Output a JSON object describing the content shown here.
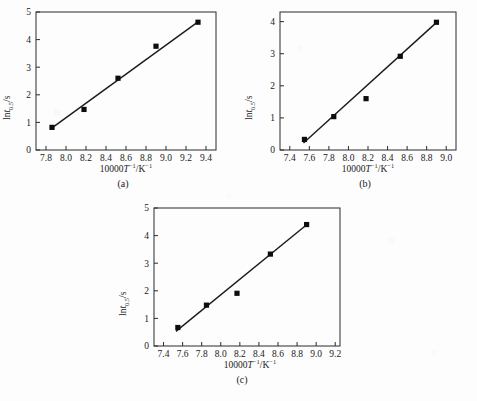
{
  "figure": {
    "background_color": "#fdfdfd",
    "line_color": "#1a1a1a",
    "marker_color": "#0d0d0d",
    "marker_shape": "filled-square"
  },
  "axis_titles": {
    "x_prefix": "10000",
    "x_variable": "T",
    "x_sup1": "−1",
    "x_mid": "/K",
    "x_sup2": "−1",
    "y_prefix": "ln",
    "y_variable": "t",
    "y_sub": "0.5",
    "y_suffix": "/s"
  },
  "chart_data": [
    {
      "type": "scatter",
      "panel": "a",
      "caption": "(a)",
      "title": "",
      "xlabel": "10000T⁻¹/K⁻¹",
      "ylabel": "ln t0.5/s",
      "xlim": [
        7.7,
        9.5
      ],
      "ylim": [
        0,
        5
      ],
      "xticks": [
        7.8,
        8.0,
        8.2,
        8.4,
        8.6,
        8.8,
        9.0,
        9.2,
        9.4
      ],
      "xtick_labels": [
        "7.8",
        "8.0",
        "8.2",
        "8.4",
        "8.6",
        "8.8",
        "9.0",
        "9.2",
        "9.4"
      ],
      "yticks": [
        0,
        1,
        2,
        3,
        4,
        5
      ],
      "ytick_labels": [
        "0",
        "1",
        "2",
        "3",
        "4",
        "5"
      ],
      "grid": false,
      "legend": "none",
      "x": [
        7.86,
        8.18,
        8.52,
        8.9,
        9.32
      ],
      "y": [
        0.82,
        1.47,
        2.6,
        3.76,
        4.63
      ],
      "fit_line": {
        "x": [
          7.86,
          9.32
        ],
        "y": [
          0.8,
          4.64
        ]
      }
    },
    {
      "type": "scatter",
      "panel": "b",
      "caption": "(b)",
      "title": "",
      "xlabel": "10000T⁻¹/K⁻¹",
      "ylabel": "ln t0.5/s",
      "xlim": [
        7.3,
        9.1
      ],
      "ylim": [
        0,
        4.3
      ],
      "xticks": [
        7.4,
        7.6,
        7.8,
        8.0,
        8.2,
        8.4,
        8.6,
        8.8,
        9.0
      ],
      "xtick_labels": [
        "7.4",
        "7.6",
        "7.8",
        "8.0",
        "8.2",
        "8.4",
        "8.6",
        "8.8",
        "9.0"
      ],
      "yticks": [
        0,
        1,
        2,
        3,
        4
      ],
      "ytick_labels": [
        "0",
        "1",
        "2",
        "3",
        "4"
      ],
      "grid": false,
      "legend": "none",
      "x": [
        7.55,
        7.85,
        8.18,
        8.53,
        8.9
      ],
      "y": [
        0.33,
        1.04,
        1.6,
        2.92,
        3.98
      ],
      "fit_line": {
        "x": [
          7.54,
          8.91
        ],
        "y": [
          0.22,
          4.0
        ]
      }
    },
    {
      "type": "scatter",
      "panel": "c",
      "caption": "(c)",
      "title": "",
      "xlabel": "10000T⁻¹/K⁻¹",
      "ylabel": "ln t0.5/s",
      "xlim": [
        7.3,
        9.25
      ],
      "ylim": [
        0,
        5
      ],
      "xticks": [
        7.4,
        7.6,
        7.8,
        8.0,
        8.2,
        8.4,
        8.6,
        8.8,
        9.0,
        9.2
      ],
      "xtick_labels": [
        "7.4",
        "7.6",
        "7.8",
        "8.0",
        "8.2",
        "8.4",
        "8.6",
        "8.8",
        "9.0",
        "9.2"
      ],
      "yticks": [
        0,
        1,
        2,
        3,
        4,
        5
      ],
      "ytick_labels": [
        "0",
        "1",
        "2",
        "3",
        "4",
        "5"
      ],
      "grid": false,
      "legend": "none",
      "x": [
        7.55,
        7.85,
        8.17,
        8.52,
        8.9
      ],
      "y": [
        0.67,
        1.48,
        1.91,
        3.33,
        4.4
      ],
      "fit_line": {
        "x": [
          7.53,
          8.91
        ],
        "y": [
          0.53,
          4.42
        ]
      }
    }
  ]
}
